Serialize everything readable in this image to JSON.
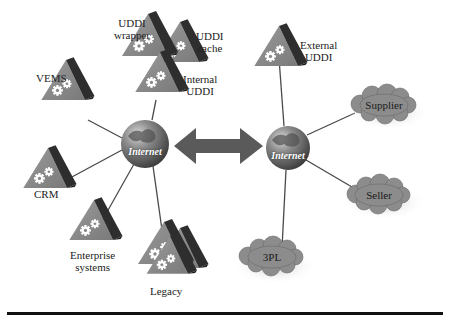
{
  "diagram": {
    "type": "network-architecture",
    "colors": {
      "node_fill": "#8a8a8a",
      "node_dark": "#2e2e2e",
      "gear": "#ffffff",
      "cloud_fill": "#8c8c8c",
      "line": "#4a4a4a",
      "arrow": "#5a5a5a",
      "globe": "#6b6b6b",
      "rule": "#111111"
    },
    "left_hub": {
      "label": "Internet"
    },
    "right_hub": {
      "label": "Internet"
    },
    "left_nodes": [
      {
        "id": "uddi-wrapper",
        "label_line1": "UDDI",
        "label_line2": "wrapper"
      },
      {
        "id": "uddi-cache",
        "label_line1": "UDDI",
        "label_line2": "cache"
      },
      {
        "id": "internal-uddi",
        "label_line1": "Internal",
        "label_line2": "UDDI"
      },
      {
        "id": "vems",
        "label_line1": "VEMS"
      },
      {
        "id": "crm",
        "label_line1": "CRM"
      },
      {
        "id": "enterprise-systems",
        "label_line1": "Enterprise",
        "label_line2": "systems"
      },
      {
        "id": "legacy",
        "label_line1": "Legacy"
      }
    ],
    "right_nodes": [
      {
        "id": "external-uddi",
        "label_line1": "External",
        "label_line2": "UDDI"
      },
      {
        "id": "supplier",
        "label": "Supplier"
      },
      {
        "id": "seller",
        "label": "Seller"
      },
      {
        "id": "3pl",
        "label": "3PL"
      }
    ],
    "connector": {
      "type": "bidirectional-arrow",
      "between": [
        "left_hub",
        "right_hub"
      ]
    }
  }
}
